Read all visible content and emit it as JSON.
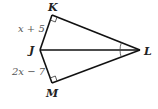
{
  "diagram": {
    "type": "kite / two right triangles sharing hypotenuse JL",
    "vertices": {
      "K": {
        "label": "K",
        "x": 52,
        "y": 15
      },
      "J": {
        "label": "J",
        "x": 40,
        "y": 50
      },
      "L": {
        "label": "L",
        "x": 140,
        "y": 50
      },
      "M": {
        "label": "M",
        "x": 52,
        "y": 83
      }
    },
    "side_labels": {
      "JK": "x + 5",
      "JM": "2x − 7"
    },
    "right_angles": [
      "K",
      "M"
    ],
    "congruent_angles": [
      "KLJ",
      "MLJ"
    ],
    "colors": {
      "stroke": "#111111",
      "text": "#222222",
      "expr_text": "#555555"
    }
  }
}
